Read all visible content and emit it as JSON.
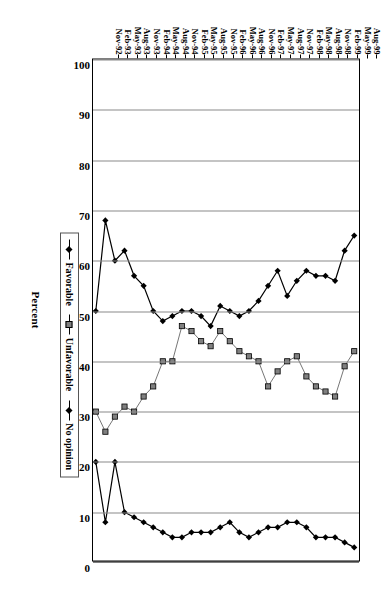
{
  "chart_data": {
    "type": "line",
    "title": "",
    "xlabel": "",
    "ylabel": "Percent",
    "ylim": [
      0,
      100
    ],
    "yticks": [
      0,
      10,
      20,
      30,
      40,
      50,
      60,
      70,
      80,
      90,
      100
    ],
    "grid": true,
    "orientation": "page-rotated-90",
    "legend_position": "bottom-right",
    "categories": [
      "Nov-92",
      "Feb-93",
      "May-93",
      "Aug-93",
      "Nov-93",
      "Feb-94",
      "May-94",
      "Aug-94",
      "Nov-94",
      "Feb-95",
      "May-95",
      "Aug-95",
      "Nov-95",
      "Feb-96",
      "May-96",
      "Aug-96",
      "Nov-96",
      "Feb-97",
      "May-97",
      "Aug-97",
      "Nov-97",
      "Feb-98",
      "May-98",
      "Aug-98",
      "Nov-98",
      "Feb-99",
      "May-99",
      "Aug-99"
    ],
    "series": [
      {
        "name": "Favorable",
        "marker": "diamond",
        "color": "#000000",
        "values": [
          50,
          68,
          60,
          62,
          57,
          55,
          50,
          48,
          49,
          50,
          50,
          49,
          47,
          51,
          50,
          49,
          50,
          52,
          55,
          58,
          53,
          56,
          58,
          57,
          57,
          56,
          62,
          65
        ]
      },
      {
        "name": "Unfavorable",
        "marker": "square",
        "color": "#808080",
        "values": [
          30,
          26,
          29,
          31,
          30,
          33,
          35,
          40,
          40,
          47,
          46,
          44,
          43,
          46,
          44,
          42,
          41,
          40,
          35,
          38,
          40,
          41,
          37,
          35,
          34,
          33,
          39,
          42
        ]
      },
      {
        "name": "No opinion",
        "marker": "diamond",
        "color": "#000000",
        "values": [
          20,
          8,
          20,
          10,
          9,
          8,
          7,
          6,
          5,
          5,
          6,
          6,
          6,
          7,
          8,
          6,
          5,
          6,
          7,
          7,
          8,
          8,
          7,
          5,
          5,
          5,
          4,
          3
        ]
      }
    ]
  },
  "axis": {
    "value_title": "Percent",
    "value_ticks": [
      "100",
      "90",
      "80",
      "70",
      "60",
      "50",
      "40",
      "30",
      "20",
      "10",
      "0"
    ]
  },
  "legend": {
    "items": [
      {
        "label": "Favorable",
        "marker": "diamond-filled"
      },
      {
        "label": "Unfavorable",
        "marker": "square-gray"
      },
      {
        "label": "No opinion",
        "marker": "diamond-filled"
      }
    ]
  }
}
